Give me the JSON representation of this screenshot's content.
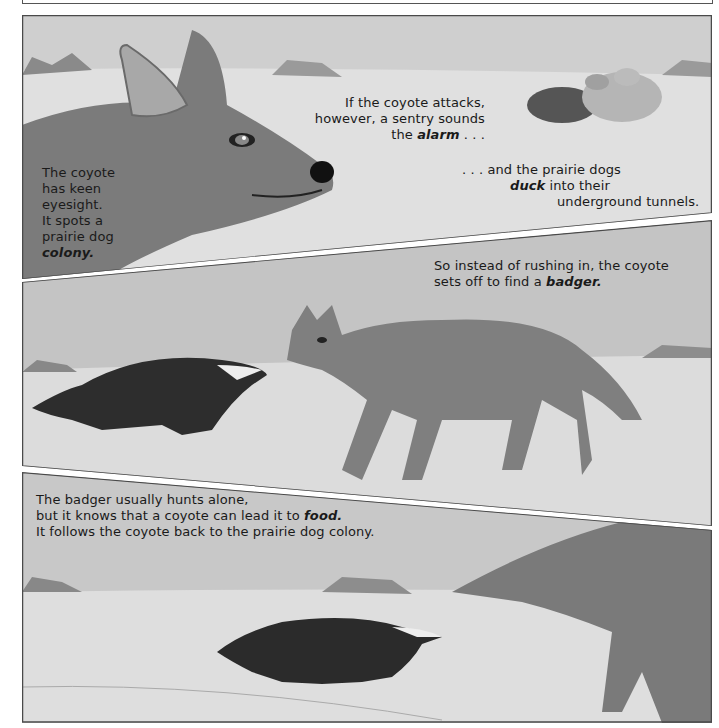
{
  "panels": [
    {
      "id": 1,
      "caption_left": {
        "lines": [
          "The coyote",
          "has keen",
          "eyesight.",
          "It spots a",
          "prairie dog"
        ],
        "emph": "colony."
      },
      "caption_mid": {
        "line1": "If the coyote attacks,",
        "line2": "however, a sentry sounds",
        "line3_pre": "the ",
        "line3_emph": "alarm",
        "line3_post": " . . ."
      },
      "caption_right": {
        "line1": ". . . and the prairie dogs",
        "line2_emph": "duck",
        "line2_post": " into their",
        "line3": "underground tunnels."
      }
    },
    {
      "id": 2,
      "caption": {
        "line1": "So instead of rushing in, the coyote",
        "line2_pre": "sets off to find a ",
        "line2_emph": "badger."
      }
    },
    {
      "id": 3,
      "caption": {
        "line1": "The badger usually hunts alone,",
        "line2_pre": "but it knows that a coyote can lead it to ",
        "line2_emph": "food.",
        "line3": "It follows the coyote back to the prairie dog colony."
      }
    }
  ],
  "colors": {
    "sky": "#c9c9c9",
    "ground": "#dedede",
    "coyote": "#7d7d7d",
    "badger": "#2e2e2e",
    "border": "#4a4a4a"
  }
}
